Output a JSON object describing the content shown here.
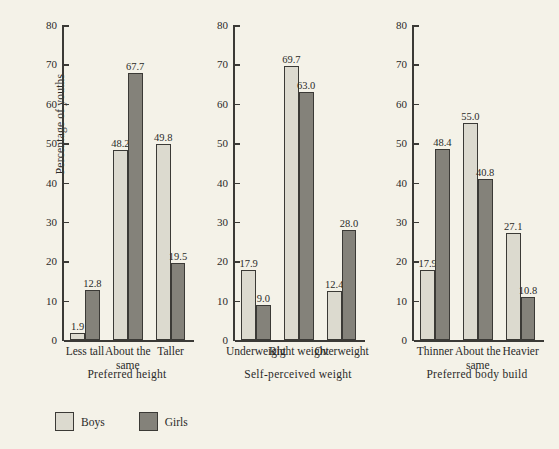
{
  "chart_data": {
    "type": "bar",
    "title": "",
    "xlabel": "",
    "ylabel": "Percentage of youths",
    "ylim": [
      0,
      80
    ],
    "yticks": [
      0,
      10,
      20,
      30,
      40,
      50,
      60,
      70,
      80
    ],
    "ytick_labels": [
      "0",
      "10",
      "20",
      "30",
      "40",
      "50",
      "60",
      "70",
      "80"
    ],
    "grid": false,
    "legend_position": "bottom-left",
    "series_names": [
      "Boys",
      "Girls"
    ],
    "colors": {
      "boys": "#dcdacf",
      "girls": "#84827a",
      "outline": "#3b3a36",
      "background": "#f4f2e8"
    },
    "panels": [
      {
        "title": "Preferred height",
        "categories": [
          "Less tall",
          "About the same",
          "Taller"
        ],
        "series": [
          {
            "name": "Boys",
            "values": [
              1.9,
              48.2,
              49.8
            ]
          },
          {
            "name": "Girls",
            "values": [
              12.8,
              67.7,
              19.5
            ]
          }
        ]
      },
      {
        "title": "Self-perceived weight",
        "categories": [
          "Underweight",
          "Right weight",
          "Overweight"
        ],
        "series": [
          {
            "name": "Boys",
            "values": [
              17.9,
              69.7,
              12.4
            ]
          },
          {
            "name": "Girls",
            "values": [
              9.0,
              63.0,
              28.0
            ]
          }
        ]
      },
      {
        "title": "Preferred body build",
        "categories": [
          "Thinner",
          "About the same",
          "Heavier"
        ],
        "series": [
          {
            "name": "Boys",
            "values": [
              17.9,
              55.0,
              27.1
            ]
          },
          {
            "name": "Girls",
            "values": [
              48.4,
              40.8,
              10.8
            ]
          }
        ]
      }
    ]
  },
  "legend": {
    "items": [
      {
        "label": "Boys",
        "key": "boys"
      },
      {
        "label": "Girls",
        "key": "girls"
      }
    ]
  },
  "panel_layout": [
    {
      "left": 62,
      "width": 130
    },
    {
      "left": 233,
      "width": 130
    },
    {
      "left": 412,
      "width": 130
    }
  ]
}
